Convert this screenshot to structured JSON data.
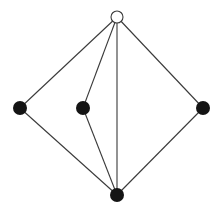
{
  "diagram": {
    "type": "graph",
    "colors": {
      "edge": "#3a3a3a",
      "filled_node": "#141414",
      "open_node_fill": "#ffffff",
      "background": "#ffffff"
    },
    "nodes": [
      {
        "id": "top",
        "x": 117,
        "y": 17,
        "r": 6,
        "style": "open"
      },
      {
        "id": "left",
        "x": 20,
        "y": 108,
        "r": 7,
        "style": "filled"
      },
      {
        "id": "mid-left",
        "x": 83,
        "y": 108,
        "r": 7,
        "style": "filled"
      },
      {
        "id": "right",
        "x": 203,
        "y": 108,
        "r": 7,
        "style": "filled"
      },
      {
        "id": "bottom",
        "x": 117,
        "y": 195,
        "r": 7,
        "style": "filled"
      }
    ],
    "edges": [
      {
        "from": "top",
        "to": "left"
      },
      {
        "from": "top",
        "to": "mid-left"
      },
      {
        "from": "top",
        "to": "bottom"
      },
      {
        "from": "top",
        "to": "right"
      },
      {
        "from": "left",
        "to": "bottom"
      },
      {
        "from": "mid-left",
        "to": "bottom"
      },
      {
        "from": "right",
        "to": "bottom"
      }
    ]
  }
}
